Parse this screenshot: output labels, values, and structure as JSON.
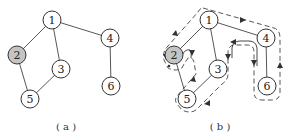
{
  "figure": {
    "panels": [
      {
        "id": "a",
        "caption": "( a )",
        "nodes": [
          {
            "label": "1",
            "x": 52,
            "y": 20,
            "highlighted": false
          },
          {
            "label": "2",
            "x": 17,
            "y": 55,
            "highlighted": true
          },
          {
            "label": "3",
            "x": 61,
            "y": 69,
            "highlighted": false
          },
          {
            "label": "4",
            "x": 110,
            "y": 38,
            "highlighted": false
          },
          {
            "label": "5",
            "x": 30,
            "y": 99,
            "highlighted": false
          },
          {
            "label": "6",
            "x": 111,
            "y": 86,
            "highlighted": false
          }
        ],
        "edges": [
          [
            "1",
            "2"
          ],
          [
            "1",
            "3"
          ],
          [
            "1",
            "4"
          ],
          [
            "2",
            "5"
          ],
          [
            "3",
            "5"
          ],
          [
            "4",
            "6"
          ]
        ]
      },
      {
        "id": "b",
        "caption": "( b )",
        "nodes": [
          {
            "label": "1",
            "x": 209,
            "y": 20,
            "highlighted": false
          },
          {
            "label": "2",
            "x": 174,
            "y": 55,
            "highlighted": true
          },
          {
            "label": "3",
            "x": 218,
            "y": 69,
            "highlighted": false
          },
          {
            "label": "4",
            "x": 266,
            "y": 38,
            "highlighted": false
          },
          {
            "label": "5",
            "x": 187,
            "y": 99,
            "highlighted": false
          },
          {
            "label": "6",
            "x": 267,
            "y": 86,
            "highlighted": false
          }
        ],
        "edges": [
          [
            "1",
            "2"
          ],
          [
            "1",
            "3"
          ],
          [
            "1",
            "4"
          ],
          [
            "2",
            "5"
          ],
          [
            "3",
            "5"
          ],
          [
            "4",
            "6"
          ]
        ],
        "annotation": "dashed traversal contour with arrows around the tree"
      }
    ],
    "colors": {
      "highlight_fill": "#c4c4c4",
      "stroke": "#333333"
    }
  }
}
